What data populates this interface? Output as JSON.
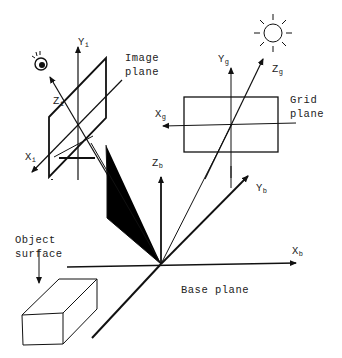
{
  "diagram": {
    "labels": {
      "image_plane_line1": "Image",
      "image_plane_line2": "plane",
      "grid_plane_line1": "Grid",
      "grid_plane_line2": "plane",
      "object_surface_line1": "Object",
      "object_surface_line2": "surface",
      "base_plane": "Base plane"
    },
    "axes": {
      "yi": {
        "main": "Y",
        "sub": "i"
      },
      "zi": {
        "main": "Z",
        "sub": "i"
      },
      "xi": {
        "main": "X",
        "sub": "i"
      },
      "yg": {
        "main": "Y",
        "sub": "g"
      },
      "zg": {
        "main": "Z",
        "sub": "g"
      },
      "xg": {
        "main": "X",
        "sub": "g"
      },
      "zb": {
        "main": "Z",
        "sub": "b"
      },
      "yb": {
        "main": "Y",
        "sub": "b"
      },
      "xb": {
        "main": "X",
        "sub": "b"
      }
    },
    "icons": [
      "camera-icon",
      "light-source-icon"
    ]
  }
}
